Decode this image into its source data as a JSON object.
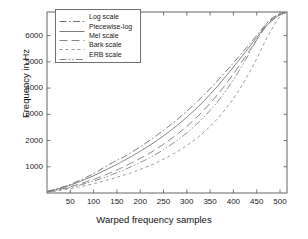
{
  "chart_data": {
    "type": "line",
    "title": "",
    "xlabel": "Warped frequency samples",
    "ylabel": "Frequency in Hz",
    "xlim": [
      0,
      515
    ],
    "ylim": [
      0,
      6900
    ],
    "xticks": [
      50,
      100,
      150,
      200,
      250,
      300,
      350,
      400,
      450,
      500
    ],
    "yticks": [
      1000,
      2000,
      3000,
      4000,
      5000,
      6000
    ],
    "grid": false,
    "legend_position": "upper left",
    "x": [
      0,
      25,
      50,
      75,
      100,
      125,
      150,
      160,
      175,
      200,
      225,
      250,
      275,
      300,
      325,
      350,
      375,
      400,
      425,
      450,
      475,
      500,
      512
    ],
    "series": [
      {
        "name": "Log scale",
        "color": "#666666",
        "dash": "dash-dot",
        "values": [
          60,
          180,
          330,
          520,
          740,
          1000,
          1250,
          1330,
          1480,
          1760,
          2060,
          2390,
          2740,
          3120,
          3530,
          3980,
          4460,
          4960,
          5480,
          6010,
          6520,
          6830,
          6870
        ]
      },
      {
        "name": "Piecewise-log",
        "color": "#707070",
        "dash": "solid",
        "values": [
          55,
          160,
          300,
          470,
          660,
          870,
          1090,
          1190,
          1330,
          1590,
          1870,
          2180,
          2520,
          2890,
          3300,
          3760,
          4260,
          4800,
          5360,
          5930,
          6450,
          6800,
          6870
        ]
      },
      {
        "name": "Mel scale",
        "color": "#777777",
        "dash": "long-dash",
        "values": [
          45,
          130,
          240,
          370,
          520,
          690,
          880,
          960,
          1090,
          1320,
          1570,
          1860,
          2180,
          2540,
          2950,
          3420,
          3950,
          4540,
          5180,
          5840,
          6450,
          6810,
          6870
        ]
      },
      {
        "name": "Bark scale",
        "color": "#8a8a8a",
        "dash": "short-dash",
        "values": [
          30,
          90,
          165,
          255,
          355,
          470,
          600,
          655,
          740,
          900,
          1080,
          1290,
          1530,
          1810,
          2140,
          2540,
          3020,
          3600,
          4300,
          5120,
          6020,
          6730,
          6870
        ]
      },
      {
        "name": "ERB scale",
        "color": "#7a7a7a",
        "dash": "dash-dot-dot",
        "values": [
          40,
          115,
          210,
          325,
          455,
          605,
          775,
          845,
          960,
          1160,
          1390,
          1650,
          1950,
          2290,
          2690,
          3150,
          3690,
          4320,
          5040,
          5840,
          6550,
          6830,
          6870
        ]
      }
    ]
  },
  "legend": {
    "items": [
      {
        "label": "Log scale"
      },
      {
        "label": "Piecewise-log"
      },
      {
        "label": "Mel scale"
      },
      {
        "label": "Bark scale"
      },
      {
        "label": "ERB scale"
      }
    ]
  },
  "axes": {
    "xlabel": "Warped frequency samples",
    "ylabel": "Frequency in Hz",
    "xtick_labels": [
      "50",
      "100",
      "150",
      "200",
      "250",
      "300",
      "350",
      "400",
      "450",
      "500"
    ],
    "ytick_labels": [
      "1000",
      "2000",
      "3000",
      "4000",
      "5000",
      "6000"
    ]
  },
  "colors": {
    "axis": "#555555",
    "text": "#1a1a1a",
    "background": "#ffffff"
  }
}
